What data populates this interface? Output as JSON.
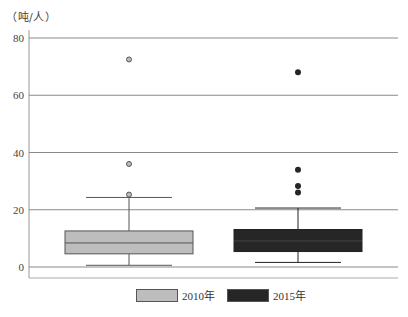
{
  "chart_data": {
    "type": "boxplot",
    "title": "",
    "ylabel": "（吨/人）",
    "xlabel": "",
    "ylim": [
      0,
      80
    ],
    "yticks": [
      0,
      20,
      40,
      60,
      80
    ],
    "grid": true,
    "legend_position": "bottom",
    "series": [
      {
        "name": "2010年",
        "color": "#bdbdbd",
        "whisker_low": 0.6,
        "q1": 4.6,
        "median": 8.4,
        "q3": 12.6,
        "whisker_high": 24.3,
        "outliers": [
          25.3,
          36.0,
          72.5
        ],
        "outlier_style": "hollow"
      },
      {
        "name": "2015年",
        "color": "#262626",
        "whisker_low": 1.6,
        "q1": 5.4,
        "median": 9.1,
        "q3": 13.1,
        "whisker_high": 20.6,
        "outliers": [
          26.0,
          28.3,
          34.0,
          68.0
        ],
        "outlier_style": "filled"
      }
    ]
  },
  "unit_label": "（吨/人）",
  "legend": {
    "items": [
      {
        "label": "2010年",
        "color": "#bdbdbd"
      },
      {
        "label": "2015年",
        "color": "#262626"
      }
    ]
  }
}
